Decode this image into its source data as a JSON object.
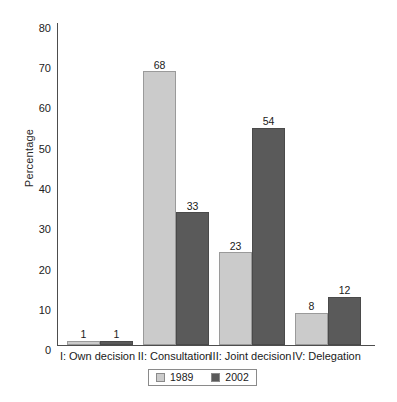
{
  "chart_data": {
    "type": "bar",
    "title": "",
    "xlabel": "",
    "ylabel": "Percentage",
    "ylim": [
      0,
      80
    ],
    "ytick_step": 10,
    "yticks": [
      "80",
      "70",
      "60",
      "50",
      "40",
      "30",
      "20",
      "10",
      "0"
    ],
    "grid": false,
    "legend_position": "bottom-center",
    "categories": [
      "I: Own decision",
      "II: Consultation",
      "III: Joint decision",
      "IV: Delegation"
    ],
    "series": [
      {
        "name": "1989",
        "color": "#cbcbcb",
        "values": [
          1,
          68,
          23,
          8
        ]
      },
      {
        "name": "2002",
        "color": "#5a5a5a",
        "values": [
          1,
          33,
          54,
          12
        ]
      }
    ],
    "data_labels": [
      [
        "1",
        "68",
        "23",
        "8"
      ],
      [
        "1",
        "33",
        "54",
        "12"
      ]
    ]
  },
  "legend": {
    "entries": [
      {
        "label": "1989"
      },
      {
        "label": "2002"
      }
    ]
  },
  "colors": {
    "series_1989": "#cbcbcb",
    "series_2002": "#5a5a5a",
    "axis": "#4d4d4d",
    "background": "#ffffff"
  }
}
